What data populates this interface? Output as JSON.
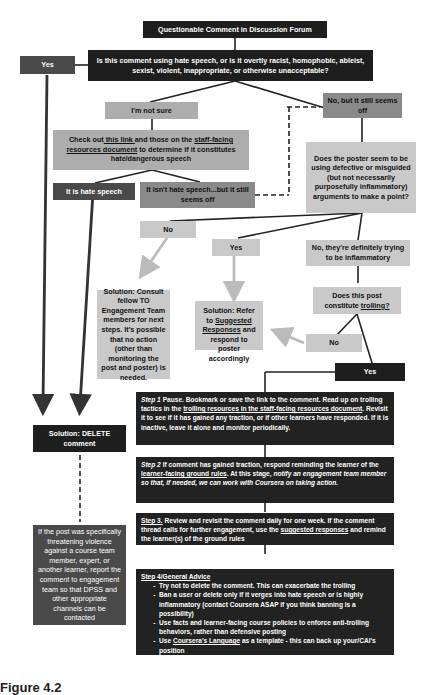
{
  "title": "Questionable Comment in Discussion Forum",
  "question1": "Is this comment using hate speech, or is it overtly racist, homophobic, ableist, sexist, violent, inappropriate, or otherwise unacceptable?",
  "yes_top": "Yes",
  "not_sure": "I'm not sure",
  "no_but_off": "No, but it still seems off",
  "check": {
    "pre": "Check out",
    "link1": " this link ",
    "mid": "and those on the ",
    "link2": "staff-facing resources document",
    "post": " to determine if it constitutes hate/dangerous speech"
  },
  "is_hate": "It is hate speech",
  "isnt_hate": "It isn't hate speech...but it still seems off",
  "question2": "Does the poster seem to be using defective or misguided (but not necessarily purposefully inflammatory) arguments to make a point?",
  "no1": "No",
  "yes2": "Yes",
  "inflammatory": "No, they're definitely trying to be inflammatory",
  "solution_consult": "Solution: Consult fellow TO Engagement Team members for next steps. It's possible that no action (other than monitoring the post and poster) is needed.",
  "solution_refer": {
    "pre": "Solution: Refer to ",
    "link": "Suggested Responses",
    "post": " and respond to poster accordingly"
  },
  "trolling_q": {
    "pre": "Does this post constitute ",
    "link": "trolling?"
  },
  "no2": "No",
  "yes3": "Yes",
  "delete": "Solution: DELETE comment",
  "threat": "If the post was specifically threatening violence against a course team member, expert, or another learner, report the comment to engagement team so that DPSS and other appropriate channels can be contacted",
  "step1": {
    "label": "Step 1",
    "t1": " Pause. Bookmark or save the link to the comment. Read up on trolling tactics in the ",
    "link": "trolling resources in the staff-facing resources document",
    "t2": ". Revisit it to see if it has gained any traction, or if other learners have responded. If it is inactive, leave it alone and monitor periodically."
  },
  "step2": {
    "label": "Step 2",
    "t1": " If comment has gained traction, respond reminding the learner of the ",
    "link": "learner-facing ground rules",
    "t2": ". At this stage, ",
    "ital": "notify an engagement team member so that, if needed, we can work with Coursera on taking action."
  },
  "step3": {
    "label": "Step 3.",
    "t1": " Review and revisit the comment daily for one week. If the comment thread calls for further engagement, use the ",
    "link": "suggested responses",
    "t2": " and remind the learner(s) of the ground rules"
  },
  "step4": {
    "label": "Step 4/General Advice",
    "items": [
      "Try not to delete the comment. This can exacerbate the trolling",
      "Ban a user or delete only if it verges into hate speech or is highly inflammatory (contact Coursera ASAP if you think banning is a possibility)",
      "Use facts and learner-facing course policies to enforce anti-trolling behaviors, rather than defensive posting"
    ],
    "last_pre": "Use ",
    "last_link": "Coursera's Language",
    "last_post": " as a template - this can back up your/CAI's position"
  },
  "caption": "Figure 4.2"
}
